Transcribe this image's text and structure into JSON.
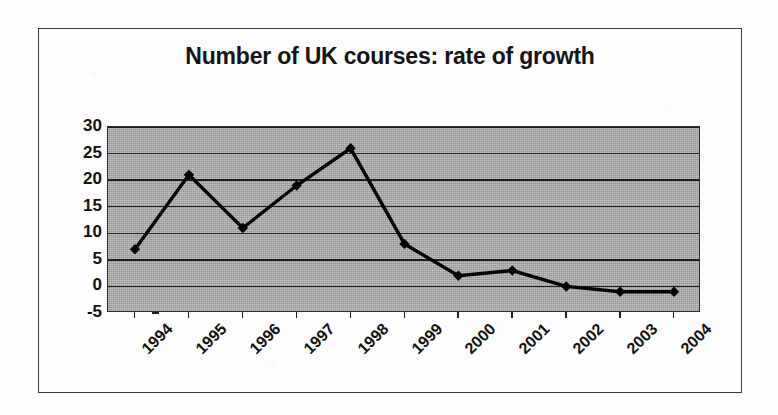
{
  "figure": {
    "title": "Number of UK courses: rate of growth",
    "border_color": "#3b3b3b",
    "plot_background_color": "#a9a9a9",
    "series_color": "#000000"
  },
  "chart_data": {
    "type": "line",
    "title": "Number of UK courses: rate of growth",
    "xlabel": "",
    "ylabel": "",
    "categories": [
      "1994",
      "1995",
      "1996",
      "1997",
      "1998",
      "1999",
      "2000",
      "2001",
      "2002",
      "2003",
      "2004"
    ],
    "values": [
      7,
      21,
      11,
      19,
      26,
      8,
      2,
      3,
      0,
      -1,
      -1
    ],
    "ylim": [
      -5,
      30
    ],
    "yticks": [
      -5,
      0,
      5,
      10,
      15,
      20,
      25,
      30
    ],
    "ytick_labels": [
      "-5",
      "0",
      "5",
      "10",
      "15",
      "20",
      "25",
      "30"
    ],
    "grid": true,
    "grid_axis": "y",
    "legend": false,
    "marker": "diamond",
    "series": [
      {
        "name": "rate of growth",
        "values": [
          7,
          21,
          11,
          19,
          26,
          8,
          2,
          3,
          0,
          -1,
          -1
        ]
      }
    ]
  }
}
